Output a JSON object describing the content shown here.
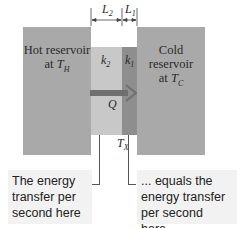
{
  "diagram": {
    "hot_reservoir": {
      "line1": "Hot reservoir",
      "line2_prefix": "at ",
      "temp_symbol": "T",
      "temp_sub": "H"
    },
    "cold_reservoir": {
      "line1": "Cold reservoir",
      "line2_prefix": "at ",
      "temp_symbol": "T",
      "temp_sub": "C"
    },
    "slab2": {
      "label_symbol": "k",
      "label_sub": "2",
      "width_symbol": "L",
      "width_sub": "2",
      "color": "#c8c8c8"
    },
    "slab1": {
      "label_symbol": "k",
      "label_sub": "1",
      "width_symbol": "L",
      "width_sub": "1",
      "color": "#8e8e8e"
    },
    "heat_flow": {
      "symbol": "Q",
      "arrow_color": "#6f6f6f"
    },
    "interface_temp": {
      "symbol": "T",
      "sub": "X"
    },
    "captions": {
      "left": [
        "The energy",
        "transfer per",
        "second here ..."
      ],
      "right": [
        "... equals the",
        "energy transfer",
        "per second here."
      ]
    },
    "colors": {
      "reservoir": "#a9a9a9",
      "caption_bg": "#f2f2f2"
    }
  }
}
